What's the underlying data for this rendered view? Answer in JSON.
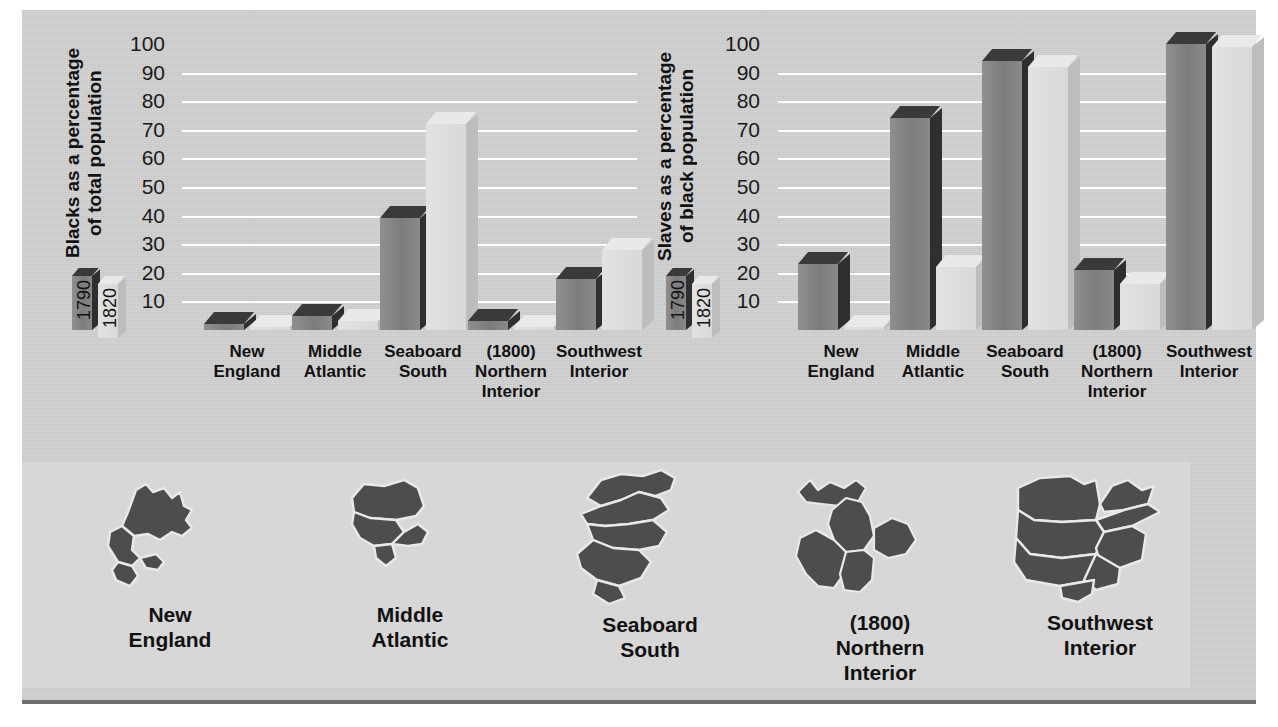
{
  "figure": {
    "background_color": "#d2d2d2",
    "map_band_color": "#d7d7d7",
    "series_colors": {
      "1790": "#7c7c7c",
      "1820": "#dcdcdc"
    }
  },
  "legend": {
    "series_1790": "1790",
    "series_1820": "1820"
  },
  "regions": [
    {
      "line1": "New",
      "line2": "England",
      "line3": ""
    },
    {
      "line1": "Middle",
      "line2": "Atlantic",
      "line3": ""
    },
    {
      "line1": "Seaboard",
      "line2": "South",
      "line3": ""
    },
    {
      "line1": "(1800)",
      "line2": "Northern",
      "line3": "Interior"
    },
    {
      "line1": "Southwest",
      "line2": "Interior",
      "line3": ""
    }
  ],
  "map_labels": [
    "New\nEngland",
    "Middle\nAtlantic",
    "Seaboard\nSouth",
    "(1800)\nNorthern\nInterior",
    "Southwest\nInterior"
  ],
  "map_icon_names": [
    "new-england-map-icon",
    "middle-atlantic-map-icon",
    "seaboard-south-map-icon",
    "northern-interior-map-icon",
    "southwest-interior-map-icon"
  ],
  "chart_data": [
    {
      "id": "blacks-share",
      "type": "bar",
      "title": "",
      "ylabel": "Blacks as a percentage\nof total population",
      "xlabel": "",
      "ylim": [
        0,
        100
      ],
      "yticks": [
        10,
        20,
        30,
        40,
        50,
        60,
        70,
        80,
        90,
        100
      ],
      "grid": true,
      "legend_position": "left",
      "categories": [
        "New England",
        "Middle Atlantic",
        "Seaboard South",
        "(1800) Northern Interior",
        "Southwest Interior"
      ],
      "series": [
        {
          "name": "1790",
          "values": [
            2,
            5,
            39,
            3,
            18
          ]
        },
        {
          "name": "1820",
          "values": [
            1,
            3,
            72,
            1,
            28
          ]
        }
      ]
    },
    {
      "id": "slaves-share",
      "type": "bar",
      "title": "",
      "ylabel": "Slaves as a percentage\nof black population",
      "xlabel": "",
      "ylim": [
        0,
        100
      ],
      "yticks": [
        10,
        20,
        30,
        40,
        50,
        60,
        70,
        80,
        90,
        100
      ],
      "grid": true,
      "legend_position": "left",
      "categories": [
        "New England",
        "Middle Atlantic",
        "Seaboard South",
        "(1800) Northern Interior",
        "Southwest Interior"
      ],
      "series": [
        {
          "name": "1790",
          "values": [
            23,
            74,
            94,
            21,
            100
          ]
        },
        {
          "name": "1820",
          "values": [
            1,
            22,
            92,
            16,
            99
          ]
        }
      ]
    }
  ]
}
